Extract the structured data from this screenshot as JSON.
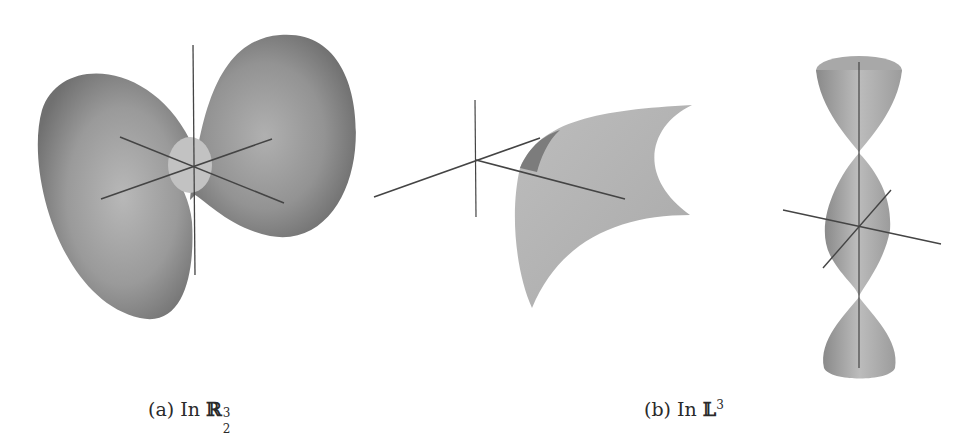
{
  "figure": {
    "panels": [
      {
        "id": "a",
        "label": "(a)",
        "text": "In",
        "space_symbol": "ℝ",
        "space_sup": "3",
        "space_sub": "2",
        "description": "saddle-like surface of revolution with two lobes, shown with three coordinate axes"
      },
      {
        "id": "b",
        "label": "(b)",
        "text": "In",
        "space_symbol": "𝕃",
        "space_sup": "3",
        "description": "curved surface patch and a stack of cone-like surfaces along a vertical axis, shown with coordinate axes"
      }
    ],
    "colors": {
      "surface_dark": "#6e6e6e",
      "surface_mid": "#9a9a9a",
      "surface_light": "#c4c4c4",
      "axis": "#444444",
      "background": "#ffffff"
    }
  }
}
